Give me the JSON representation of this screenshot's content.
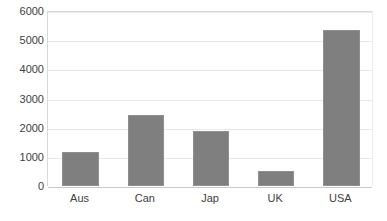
{
  "chart_data": {
    "type": "bar",
    "title": "",
    "subtitle": "",
    "xlabel": "",
    "ylabel": "",
    "categories": [
      "Aus",
      "Can",
      "Jap",
      "UK",
      "USA"
    ],
    "values": [
      1150,
      2450,
      1870,
      530,
      5350
    ],
    "series": [
      {
        "name": "Series 1",
        "values": [
          1150,
          2450,
          1870,
          530,
          5350
        ],
        "color": "#7f7f7f"
      }
    ],
    "ylim": [
      0,
      6000
    ],
    "ytick_labels": [
      "0",
      "1000",
      "2000",
      "3000",
      "4000",
      "5000",
      "6000"
    ],
    "ytick_values": [
      0,
      1000,
      2000,
      3000,
      4000,
      5000,
      6000
    ],
    "grid": true,
    "grid_axis": "y",
    "legend": false,
    "legend_position": "none",
    "annotations": []
  },
  "style": {
    "bar_color": "#7f7f7f",
    "bar_border_color": "#8f8f8f",
    "grid_color": "#e8e8e8",
    "axis_color": "#c9c9c9",
    "tick_label_color": "#404040",
    "background": "#ffffff"
  }
}
